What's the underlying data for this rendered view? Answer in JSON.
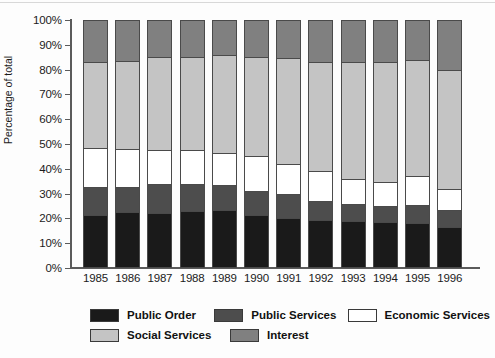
{
  "axes": {
    "y_title": "Percentage of total",
    "y_ticks": [
      "0%",
      "10%",
      "20%",
      "30%",
      "40%",
      "50%",
      "60%",
      "70%",
      "80%",
      "90%",
      "100%"
    ]
  },
  "legend": {
    "row1": [
      {
        "label": "Public Order",
        "color": "#1a1a1a"
      },
      {
        "label": "Public Services",
        "color": "#4d4d4d"
      },
      {
        "label": "Economic Services",
        "color": "#ffffff"
      }
    ],
    "row2": [
      {
        "label": "Social Services",
        "color": "#c4c4c4"
      },
      {
        "label": "Interest",
        "color": "#808080"
      }
    ]
  },
  "chart_data": {
    "type": "bar",
    "stacked": true,
    "title": "",
    "xlabel": "",
    "ylabel": "Percentage of total",
    "ylim": [
      0,
      100
    ],
    "grid": false,
    "legend_position": "bottom",
    "categories": [
      "1985",
      "1986",
      "1987",
      "1988",
      "1989",
      "1990",
      "1991",
      "1992",
      "1993",
      "1994",
      "1995",
      "1996"
    ],
    "series": [
      {
        "name": "Public Order",
        "color": "#1a1a1a",
        "values": [
          21.5,
          22.5,
          22.0,
          23.0,
          23.5,
          21.5,
          20.0,
          19.5,
          19.0,
          18.5,
          18.0,
          16.5
        ]
      },
      {
        "name": "Public Services",
        "color": "#4d4d4d",
        "values": [
          11.0,
          10.0,
          12.0,
          11.0,
          10.0,
          9.5,
          10.0,
          7.5,
          7.0,
          6.5,
          7.5,
          7.0
        ]
      },
      {
        "name": "Economic Services",
        "color": "#ffffff",
        "values": [
          16.0,
          15.5,
          13.5,
          13.5,
          13.0,
          14.0,
          12.0,
          12.0,
          10.0,
          9.5,
          11.5,
          8.5
        ]
      },
      {
        "name": "Social Services",
        "color": "#c4c4c4",
        "values": [
          34.5,
          35.5,
          37.5,
          37.5,
          39.5,
          40.0,
          42.5,
          44.0,
          47.0,
          48.5,
          47.0,
          48.0
        ]
      },
      {
        "name": "Interest",
        "color": "#808080",
        "values": [
          17.0,
          16.5,
          15.0,
          15.0,
          14.0,
          15.0,
          15.5,
          17.0,
          17.0,
          17.0,
          16.0,
          20.0
        ]
      }
    ]
  }
}
